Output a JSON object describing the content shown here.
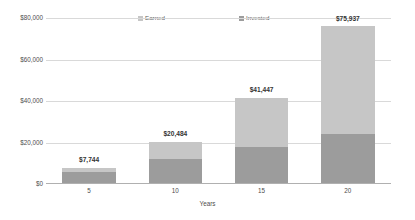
{
  "chart_data": {
    "type": "bar",
    "stacked": true,
    "title": "",
    "subtitle": "",
    "xlabel": "Years",
    "ylabel": "",
    "categories": [
      "5",
      "10",
      "15",
      "20"
    ],
    "x": [
      5,
      10,
      15,
      20
    ],
    "series": [
      {
        "name": "Invested",
        "values": [
          6000,
          12000,
          18000,
          24000
        ],
        "color": "#9c9c9c"
      },
      {
        "name": "Earned",
        "values": [
          1744,
          8484,
          23447,
          51937
        ],
        "color": "#c6c6c6"
      }
    ],
    "totals": [
      7744,
      20484,
      41447,
      75937
    ],
    "data_labels": [
      "$7,744",
      "$20,484",
      "$41,447",
      "$75,937"
    ],
    "ylim": [
      0,
      80000
    ],
    "yticks": [
      0,
      20000,
      40000,
      60000,
      80000
    ],
    "ytick_labels": [
      "$0",
      "$20,000",
      "$40,000",
      "$60,000",
      "$80,000"
    ],
    "xtick_labels": [
      "5",
      "10",
      "15",
      "20"
    ],
    "grid": true,
    "grid_axis": "y",
    "legend": [
      "Earned",
      "Invested"
    ],
    "legend_position": "top",
    "background": "#ffffff",
    "grid_color": "#d9d9d9",
    "axis_color": "#b0b0b0",
    "text_color": "#4d4d4d",
    "label_color": "#333333"
  },
  "legend": {
    "earned": {
      "label": "Earned",
      "color": "#c6c6c6"
    },
    "invested": {
      "label": "Invested",
      "color": "#9c9c9c"
    }
  },
  "yaxis": {
    "ticks": [
      {
        "label": "$80,000",
        "value": 80000
      },
      {
        "label": "$60,000",
        "value": 60000
      },
      {
        "label": "$40,000",
        "value": 40000
      },
      {
        "label": "$20,000",
        "value": 20000
      },
      {
        "label": "$0",
        "value": 0
      }
    ]
  },
  "xaxis": {
    "title": "Years",
    "ticks": [
      {
        "label": "5"
      },
      {
        "label": "10"
      },
      {
        "label": "15"
      },
      {
        "label": "20"
      }
    ]
  },
  "bars": [
    {
      "category": "5",
      "total_label": "$7,744",
      "total": 7744,
      "invested": 6000,
      "earned": 1744
    },
    {
      "category": "10",
      "total_label": "$20,484",
      "total": 20484,
      "invested": 12000,
      "earned": 8484
    },
    {
      "category": "15",
      "total_label": "$41,447",
      "total": 41447,
      "invested": 18000,
      "earned": 23447
    },
    {
      "category": "20",
      "total_label": "$75,937",
      "total": 75937,
      "invested": 24000,
      "earned": 51937
    }
  ]
}
